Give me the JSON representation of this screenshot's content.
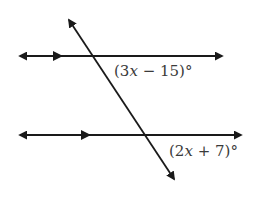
{
  "diagram": {
    "lines": {
      "top_parallel": {
        "y": 56,
        "x1": 18,
        "x2": 224,
        "parallel_marker_x": 60
      },
      "bottom_parallel": {
        "y": 135,
        "x1": 18,
        "x2": 243,
        "parallel_marker_x": 88
      },
      "transversal": {
        "x1": 68,
        "y1": 18,
        "x2": 175,
        "y2": 181
      }
    },
    "angles": [
      {
        "id": "top_angle",
        "label_open": "(",
        "coef": "3",
        "var": "x",
        "op": " − ",
        "const": "15",
        "label_close": ")",
        "degree": "°",
        "full_text": "(3x − 15)°"
      },
      {
        "id": "bottom_angle",
        "label_open": "(",
        "coef": "2",
        "var": "x",
        "op": " + ",
        "const": "7",
        "label_close": ")",
        "degree": "°",
        "full_text": "(2x + 7)°"
      }
    ],
    "colors": {
      "line": "#1a1a1a",
      "text": "#3a3a3a",
      "background": "#ffffff"
    }
  }
}
